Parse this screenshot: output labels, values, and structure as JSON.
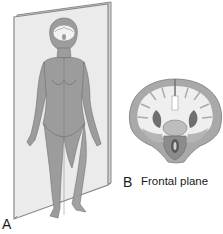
{
  "figure": {
    "panels": [
      {
        "id": "A",
        "label": "A",
        "content": "Standing human figure with frontal (coronal) plane passing through body"
      },
      {
        "id": "B",
        "label": "B",
        "caption": "Frontal plane",
        "content": "Coronal section of brain"
      }
    ]
  },
  "colors": {
    "plane_fill": "#ebebeb",
    "plane_edge": "#8a8a8a",
    "body_fill": "#9c9c9c",
    "body_shadow": "#7d7d7d",
    "brain_white": "#efefef",
    "brain_gray": "#a9a9a9",
    "brain_dark": "#6f6f6f"
  }
}
